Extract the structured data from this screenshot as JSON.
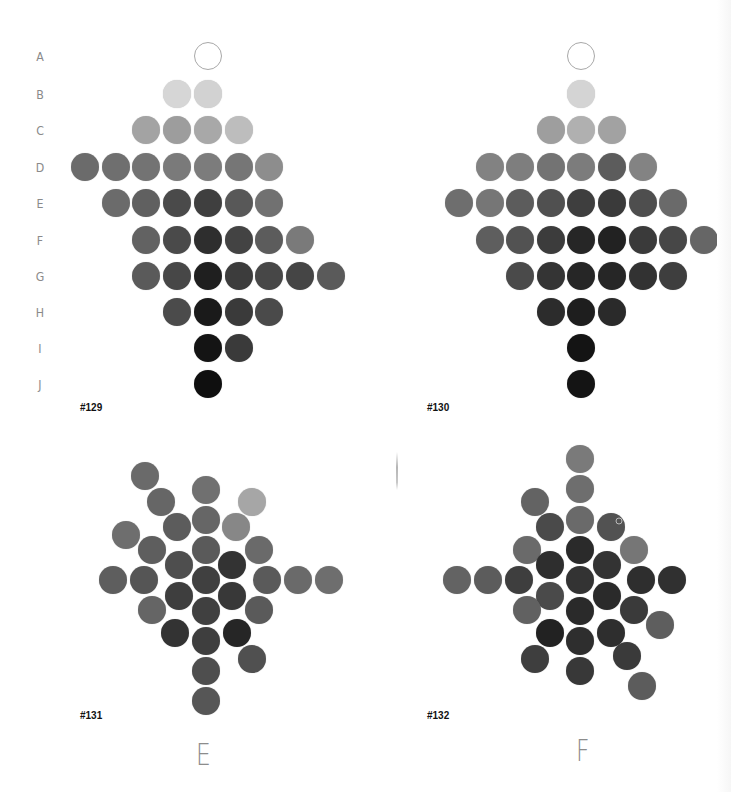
{
  "row_labels": [
    "A",
    "B",
    "C",
    "D",
    "E",
    "F",
    "G",
    "H",
    "I",
    "J"
  ],
  "row_y": [
    56,
    94,
    130,
    167,
    203,
    240,
    276,
    312,
    348,
    384
  ],
  "panels": [
    {
      "id": "#129",
      "id_pos": [
        80,
        402
      ],
      "grid_x0": 85,
      "grid_dx": 30.7,
      "rows": [
        {
          "label": "A",
          "cells": [
            [
              4,
              "outline"
            ]
          ]
        },
        {
          "label": "B",
          "cells": [
            [
              3,
              "#d6d6d6"
            ],
            [
              4,
              "#d2d2d2"
            ]
          ]
        },
        {
          "label": "C",
          "cells": [
            [
              2,
              "#a3a3a3"
            ],
            [
              3,
              "#9d9d9d"
            ],
            [
              4,
              "#a8a8a8"
            ],
            [
              5,
              "#bdbdbd"
            ]
          ]
        },
        {
          "label": "D",
          "cells": [
            [
              0,
              "#6b6b6b"
            ],
            [
              1,
              "#6f6f6f"
            ],
            [
              2,
              "#737373"
            ],
            [
              3,
              "#7a7a7a"
            ],
            [
              4,
              "#7c7c7c"
            ],
            [
              5,
              "#767676"
            ],
            [
              6,
              "#8d8d8d"
            ]
          ]
        },
        {
          "label": "E",
          "cells": [
            [
              1,
              "#6b6b6b"
            ],
            [
              2,
              "#606060"
            ],
            [
              3,
              "#4a4a4a"
            ],
            [
              4,
              "#3f3f3f"
            ],
            [
              5,
              "#585858"
            ],
            [
              6,
              "#717171"
            ]
          ]
        },
        {
          "label": "F",
          "cells": [
            [
              2,
              "#626262"
            ],
            [
              3,
              "#4a4a4a"
            ],
            [
              4,
              "#2e2e2e"
            ],
            [
              5,
              "#434343"
            ],
            [
              6,
              "#5c5c5c"
            ],
            [
              7,
              "#7a7a7a"
            ]
          ]
        },
        {
          "label": "G",
          "cells": [
            [
              2,
              "#5a5a5a"
            ],
            [
              3,
              "#474747"
            ],
            [
              4,
              "#1f1f1f"
            ],
            [
              5,
              "#3c3c3c"
            ],
            [
              6,
              "#474747"
            ],
            [
              7,
              "#454545"
            ],
            [
              8,
              "#5a5a5a"
            ]
          ]
        },
        {
          "label": "H",
          "cells": [
            [
              3,
              "#4b4b4b"
            ],
            [
              4,
              "#1a1a1a"
            ],
            [
              5,
              "#3a3a3a"
            ],
            [
              6,
              "#4a4a4a"
            ]
          ]
        },
        {
          "label": "I",
          "cells": [
            [
              4,
              "#141414"
            ],
            [
              5,
              "#3a3a3a"
            ]
          ]
        },
        {
          "label": "J",
          "cells": [
            [
              4,
              "#0f0f0f"
            ]
          ]
        }
      ]
    },
    {
      "id": "#130",
      "id_pos": [
        427,
        402
      ],
      "grid_x0": 459,
      "grid_dx": 30.6,
      "rows": [
        {
          "label": "A",
          "cells": [
            [
              4,
              "outline"
            ]
          ]
        },
        {
          "label": "B",
          "cells": [
            [
              4,
              "#d4d4d4"
            ]
          ]
        },
        {
          "label": "C",
          "cells": [
            [
              3,
              "#9e9e9e"
            ],
            [
              4,
              "#b0b0b0"
            ],
            [
              5,
              "#a2a2a2"
            ]
          ]
        },
        {
          "label": "D",
          "cells": [
            [
              1,
              "#828282"
            ],
            [
              2,
              "#7e7e7e"
            ],
            [
              3,
              "#737373"
            ],
            [
              4,
              "#7c7c7c"
            ],
            [
              5,
              "#5c5c5c"
            ],
            [
              6,
              "#838383"
            ]
          ]
        },
        {
          "label": "E",
          "cells": [
            [
              0,
              "#6e6e6e"
            ],
            [
              1,
              "#767676"
            ],
            [
              2,
              "#5c5c5c"
            ],
            [
              3,
              "#505050"
            ],
            [
              4,
              "#3e3e3e"
            ],
            [
              5,
              "#3a3a3a"
            ],
            [
              6,
              "#4e4e4e"
            ],
            [
              7,
              "#6a6a6a"
            ]
          ]
        },
        {
          "label": "F",
          "cells": [
            [
              1,
              "#5e5e5e"
            ],
            [
              2,
              "#525252"
            ],
            [
              3,
              "#3c3c3c"
            ],
            [
              4,
              "#262626"
            ],
            [
              5,
              "#222222"
            ],
            [
              6,
              "#3a3a3a"
            ],
            [
              7,
              "#474747"
            ],
            [
              8,
              "#666666"
            ]
          ]
        },
        {
          "label": "G",
          "cells": [
            [
              2,
              "#4a4a4a"
            ],
            [
              3,
              "#343434"
            ],
            [
              4,
              "#262626"
            ],
            [
              5,
              "#262626"
            ],
            [
              6,
              "#323232"
            ],
            [
              7,
              "#3e3e3e"
            ]
          ]
        },
        {
          "label": "H",
          "cells": [
            [
              3,
              "#2c2c2c"
            ],
            [
              4,
              "#1e1e1e"
            ],
            [
              5,
              "#2a2a2a"
            ]
          ]
        },
        {
          "label": "I",
          "cells": [
            [
              4,
              "#141414"
            ]
          ]
        },
        {
          "label": "J",
          "cells": [
            [
              4,
              "#141414"
            ]
          ]
        }
      ]
    },
    {
      "id": "#131",
      "id_pos": [
        80,
        710
      ],
      "caption": "E",
      "caption_pos": [
        196,
        737
      ],
      "dots": [
        [
          145,
          476,
          "#6a6a6a"
        ],
        [
          206,
          490,
          "#707070"
        ],
        [
          161,
          502,
          "#666666"
        ],
        [
          252,
          502,
          "#a6a6a6"
        ],
        [
          177,
          527,
          "#5c5c5c"
        ],
        [
          206,
          520,
          "#666666"
        ],
        [
          236,
          527,
          "#878787"
        ],
        [
          126,
          535,
          "#6e6e6e"
        ],
        [
          152,
          550,
          "#5e5e5e"
        ],
        [
          206,
          550,
          "#5a5a5a"
        ],
        [
          259,
          550,
          "#6a6a6a"
        ],
        [
          179,
          565,
          "#4e4e4e"
        ],
        [
          232,
          565,
          "#333333"
        ],
        [
          113,
          580,
          "#5e5e5e"
        ],
        [
          144,
          580,
          "#555555"
        ],
        [
          206,
          580,
          "#404040"
        ],
        [
          267,
          580,
          "#5a5a5a"
        ],
        [
          298,
          580,
          "#6a6a6a"
        ],
        [
          329,
          580,
          "#6e6e6e"
        ],
        [
          179,
          596,
          "#3e3e3e"
        ],
        [
          232,
          596,
          "#383838"
        ],
        [
          206,
          611,
          "#404040"
        ],
        [
          152,
          610,
          "#656565"
        ],
        [
          259,
          610,
          "#5a5a5a"
        ],
        [
          175,
          633,
          "#333333"
        ],
        [
          206,
          641,
          "#3e3e3e"
        ],
        [
          237,
          633,
          "#262626"
        ],
        [
          252,
          659,
          "#505050"
        ],
        [
          206,
          671,
          "#4e4e4e"
        ],
        [
          206,
          701,
          "#565656"
        ]
      ]
    },
    {
      "id": "#132",
      "id_pos": [
        427,
        710
      ],
      "caption": "F",
      "caption_pos": [
        576,
        733
      ],
      "dots": [
        [
          580,
          459,
          "#7a7a7a"
        ],
        [
          580,
          489,
          "#6e6e6e"
        ],
        [
          535,
          502,
          "#636363"
        ],
        [
          550,
          527,
          "#4a4a4a"
        ],
        [
          580,
          520,
          "#6a6a6a"
        ],
        [
          611,
          527,
          "#525252"
        ],
        [
          527,
          550,
          "#6a6a6a"
        ],
        [
          580,
          550,
          "#2a2a2a"
        ],
        [
          634,
          550,
          "#767676"
        ],
        [
          550,
          565,
          "#2e2e2e"
        ],
        [
          607,
          565,
          "#333333"
        ],
        [
          457,
          580,
          "#636363"
        ],
        [
          488,
          580,
          "#5c5c5c"
        ],
        [
          519,
          580,
          "#3e3e3e"
        ],
        [
          580,
          580,
          "#333333"
        ],
        [
          641,
          580,
          "#2e2e2e"
        ],
        [
          672,
          580,
          "#303030"
        ],
        [
          550,
          596,
          "#4a4a4a"
        ],
        [
          607,
          596,
          "#2a2a2a"
        ],
        [
          527,
          610,
          "#616161"
        ],
        [
          580,
          611,
          "#2a2a2a"
        ],
        [
          634,
          610,
          "#3a3a3a"
        ],
        [
          660,
          625,
          "#5e5e5e"
        ],
        [
          550,
          633,
          "#222222"
        ],
        [
          580,
          641,
          "#2e2e2e"
        ],
        [
          611,
          633,
          "#2e2e2e"
        ],
        [
          535,
          659,
          "#3e3e3e"
        ],
        [
          627,
          656,
          "#3a3a3a"
        ],
        [
          580,
          671,
          "#383838"
        ],
        [
          642,
          686,
          "#5c5c5c"
        ]
      ],
      "ring_mark": [
        619,
        521
      ]
    }
  ]
}
